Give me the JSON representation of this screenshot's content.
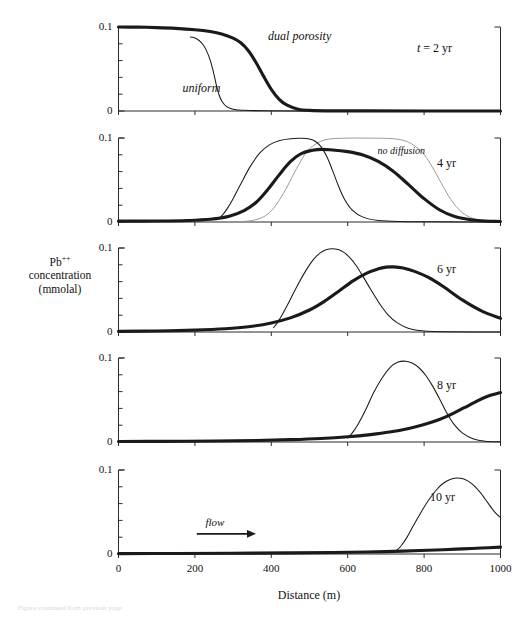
{
  "figure": {
    "yaxis_title_line1": "Pb",
    "yaxis_title_sup": "++",
    "yaxis_title_line2": "concentration",
    "yaxis_title_line3": "(mmolal)",
    "xaxis_title": "Distance (m)",
    "caption_partial": "Figure continued from previous page"
  },
  "chart_data": {
    "type": "line",
    "title": "",
    "xlabel": "Distance (m)",
    "ylabel": "Pb++ concentration (mmolal)",
    "xlim": [
      0,
      1000
    ],
    "ylim": [
      0,
      0.1
    ],
    "grid": false,
    "legend_position": "inline-annotations",
    "x_ticks": [
      0,
      200,
      400,
      600,
      800,
      1000
    ],
    "x_tick_labels": [
      "0",
      "200",
      "400",
      "600",
      "800",
      "1000"
    ],
    "y_ticks": [
      0,
      0.02,
      0.04,
      0.06,
      0.08,
      0.1
    ],
    "y_tick_labels": [
      "0",
      "",
      "",
      "",
      "",
      "0.1"
    ],
    "series_styles": [
      {
        "name": "dual porosity",
        "style": "thick-black"
      },
      {
        "name": "uniform",
        "style": "thin-black"
      },
      {
        "name": "no diffusion",
        "style": "thin-gray"
      }
    ],
    "panels": [
      {
        "id": "panel-2yr",
        "time_label": "t = 2 yr",
        "annotations": [
          {
            "text": "dual porosity",
            "x": 480,
            "y": 0.088,
            "italic": true
          },
          {
            "text": "uniform",
            "x": 215,
            "y": 0.026,
            "italic": true
          }
        ],
        "series": [
          {
            "name": "dual porosity",
            "style": "thick-black",
            "x": [
              0,
              50,
              100,
              150,
              200,
              240,
              270,
              300,
              320,
              340,
              360,
              380,
              400,
              420,
              440,
              470,
              500,
              560,
              650,
              800,
              1000
            ],
            "y": [
              0.1,
              0.0998,
              0.0993,
              0.0984,
              0.0968,
              0.0946,
              0.0918,
              0.0868,
              0.0812,
              0.0718,
              0.0578,
              0.0412,
              0.0258,
              0.0142,
              0.0072,
              0.0022,
              0.0008,
              0.0002,
              0.0001,
              0.0,
              0.0
            ]
          },
          {
            "name": "uniform",
            "style": "thin-black",
            "x": [
              188,
              192,
              200,
              210,
              220,
              230,
              240,
              248,
              255,
              262,
              270,
              282,
              300,
              330,
              380,
              460,
              560,
              1000
            ],
            "y": [
              0.088,
              0.0878,
              0.0868,
              0.0842,
              0.0798,
              0.0722,
              0.0606,
              0.0472,
              0.0332,
              0.0208,
              0.0122,
              0.0056,
              0.0022,
              0.0008,
              0.0003,
              0.0001,
              0.0,
              0.0
            ]
          }
        ]
      },
      {
        "id": "panel-4yr",
        "time_label": "4 yr",
        "annotations": [
          {
            "text": "no diffusion",
            "x": 760,
            "y": 0.082,
            "italic": true
          }
        ],
        "series": [
          {
            "name": "dual porosity",
            "style": "thick-black",
            "x": [
              0,
              100,
              180,
              240,
              290,
              330,
              360,
              390,
              420,
              450,
              480,
              520,
              560,
              600,
              640,
              680,
              720,
              760,
              800,
              840,
              880,
              940,
              1000
            ],
            "y": [
              0.001,
              0.0012,
              0.0018,
              0.0032,
              0.0068,
              0.0138,
              0.0232,
              0.0382,
              0.0558,
              0.0718,
              0.0818,
              0.0862,
              0.0858,
              0.0838,
              0.0798,
              0.0722,
              0.0602,
              0.0442,
              0.0278,
              0.0146,
              0.0066,
              0.0018,
              0.0006
            ]
          },
          {
            "name": "uniform",
            "style": "thin-black",
            "x": [
              262,
              272,
              285,
              300,
              320,
              345,
              370,
              395,
              420,
              450,
              480,
              500,
              515,
              530,
              545,
              560,
              575,
              592,
              612,
              640,
              680,
              740,
              820,
              1000
            ],
            "y": [
              0.0042,
              0.0082,
              0.0162,
              0.0278,
              0.0452,
              0.0662,
              0.0822,
              0.0918,
              0.0968,
              0.0992,
              0.0996,
              0.0988,
              0.0962,
              0.0898,
              0.0782,
              0.0618,
              0.0438,
              0.0268,
              0.0142,
              0.0058,
              0.0018,
              0.0005,
              0.0002,
              0.0
            ]
          },
          {
            "name": "no diffusion",
            "style": "thin-gray",
            "x": [
              330,
              350,
              370,
              390,
              410,
              432,
              455,
              478,
              500,
              540,
              600,
              660,
              700,
              730,
              755,
              778,
              800,
              822,
              845,
              870,
              900,
              940,
              1000
            ],
            "y": [
              0.0008,
              0.0018,
              0.0042,
              0.0092,
              0.0188,
              0.0342,
              0.0538,
              0.0732,
              0.0872,
              0.0978,
              0.0998,
              0.0998,
              0.0996,
              0.0986,
              0.0958,
              0.0898,
              0.0802,
              0.0652,
              0.0462,
              0.0268,
              0.0112,
              0.0026,
              0.0004
            ]
          }
        ]
      },
      {
        "id": "panel-6yr",
        "time_label": "6 yr",
        "annotations": [],
        "series": [
          {
            "name": "dual porosity",
            "style": "thick-black",
            "x": [
              0,
              100,
              200,
              280,
              340,
              400,
              450,
              500,
              540,
              580,
              615,
              650,
              680,
              700,
              720,
              745,
              775,
              810,
              850,
              900,
              950,
              1000
            ],
            "y": [
              0.0008,
              0.0012,
              0.0022,
              0.0038,
              0.0062,
              0.0108,
              0.0168,
              0.0262,
              0.0368,
              0.0498,
              0.0612,
              0.0702,
              0.0752,
              0.0772,
              0.0775,
              0.0762,
              0.0722,
              0.0652,
              0.0542,
              0.0382,
              0.0252,
              0.0162
            ]
          },
          {
            "name": "uniform",
            "style": "thin-black",
            "x": [
              406,
              416,
              430,
              448,
              468,
              490,
              510,
              528,
              545,
              560,
              575,
              590,
              605,
              622,
              640,
              660,
              682,
              705,
              730,
              760,
              800,
              860,
              1000
            ],
            "y": [
              0.0052,
              0.0112,
              0.0218,
              0.0372,
              0.0552,
              0.0728,
              0.0862,
              0.0942,
              0.0982,
              0.0992,
              0.0982,
              0.0948,
              0.0888,
              0.0792,
              0.0662,
              0.0508,
              0.0348,
              0.0208,
              0.0108,
              0.0042,
              0.0012,
              0.0003,
              0.0
            ]
          }
        ]
      },
      {
        "id": "panel-8yr",
        "time_label": "8 yr",
        "annotations": [],
        "series": [
          {
            "name": "dual porosity",
            "style": "thick-black",
            "x": [
              0,
              120,
              250,
              360,
              450,
              530,
              600,
              660,
              710,
              760,
              800,
              840,
              875,
              905,
              935,
              965,
              1000
            ],
            "y": [
              0.0006,
              0.0008,
              0.0012,
              0.0018,
              0.0028,
              0.0042,
              0.0062,
              0.0088,
              0.0118,
              0.0162,
              0.0208,
              0.0268,
              0.0338,
              0.0408,
              0.0478,
              0.0542,
              0.0588
            ]
          },
          {
            "name": "uniform",
            "style": "thin-black",
            "x": [
              600,
              612,
              628,
              648,
              668,
              690,
              712,
              732,
              752,
              770,
              788,
              805,
              822,
              840,
              858,
              878,
              900,
              928,
              960,
              1000
            ],
            "y": [
              0.0048,
              0.0108,
              0.0218,
              0.0392,
              0.0588,
              0.0762,
              0.0892,
              0.0952,
              0.0962,
              0.0938,
              0.0878,
              0.0788,
              0.0668,
              0.0518,
              0.0358,
              0.0212,
              0.0108,
              0.0038,
              0.0008,
              0.0002
            ]
          }
        ]
      },
      {
        "id": "panel-10yr",
        "time_label": "10 yr",
        "annotations": [
          {
            "text": "flow",
            "x": 255,
            "y": 0.036,
            "italic": true
          }
        ],
        "flow_arrow": {
          "x_start": 205,
          "x_end": 360,
          "y": 0.024
        },
        "series": [
          {
            "name": "dual porosity",
            "style": "thick-black",
            "x": [
              0,
              150,
              300,
              450,
              560,
              650,
              720,
              790,
              850,
              900,
              950,
              1000
            ],
            "y": [
              0.0004,
              0.0006,
              0.0009,
              0.0013,
              0.0018,
              0.0024,
              0.0031,
              0.0041,
              0.0051,
              0.0061,
              0.0071,
              0.0082
            ]
          },
          {
            "name": "uniform",
            "style": "thin-black",
            "x": [
              728,
              740,
              755,
              772,
              792,
              812,
              832,
              850,
              868,
              885,
              900,
              915,
              930,
              948,
              968,
              985,
              1000
            ],
            "y": [
              0.0042,
              0.0098,
              0.0198,
              0.0338,
              0.0498,
              0.0642,
              0.0762,
              0.0842,
              0.0888,
              0.0905,
              0.0898,
              0.0868,
              0.0818,
              0.0728,
              0.0602,
              0.0498,
              0.0432
            ]
          }
        ]
      }
    ]
  }
}
